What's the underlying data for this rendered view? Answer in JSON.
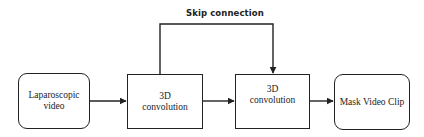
{
  "diagram": {
    "type": "flowchart",
    "nodes": [
      {
        "id": "input",
        "label_line1": "Laparoscopic",
        "label_line2": "video",
        "shape": "rounded-rectangle"
      },
      {
        "id": "conv1",
        "label_line1": "3D",
        "label_line2": "convolution",
        "shape": "rectangle"
      },
      {
        "id": "conv2",
        "label_line1": "3D",
        "label_line2": "convolution",
        "shape": "rectangle"
      },
      {
        "id": "output",
        "label_line1": "Mask Video Clip",
        "shape": "rounded-rectangle"
      }
    ],
    "edges": [
      {
        "from": "input",
        "to": "conv1"
      },
      {
        "from": "conv1",
        "to": "conv2"
      },
      {
        "from": "conv2",
        "to": "output"
      },
      {
        "from": "conv1",
        "to": "conv2",
        "label": "Skip connection",
        "routing": "over-top"
      }
    ],
    "skip_label": "Skip connection",
    "colors": {
      "stroke": "#222222",
      "background": "#ffffff",
      "text": "#222222"
    }
  }
}
